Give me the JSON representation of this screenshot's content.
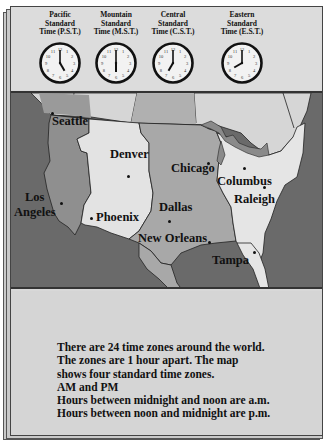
{
  "clocks": [
    {
      "zone": "Pacific",
      "line2": "Standard",
      "line3": "Time (P.S.T.)",
      "hour": 5,
      "minute": 0
    },
    {
      "zone": "Mountain",
      "line2": "Standard",
      "line3": "Time (M.S.T.)",
      "hour": 6,
      "minute": 0
    },
    {
      "zone": "Central",
      "line2": "Standard",
      "line3": "Time (C.S.T.)",
      "hour": 7,
      "minute": 0
    },
    {
      "zone": "Eastern",
      "line2": "Standard",
      "line3": "Time (E.S.T.)",
      "hour": 8,
      "minute": 0
    }
  ],
  "map": {
    "cities": [
      {
        "name": "Seattle"
      },
      {
        "name": "Denver"
      },
      {
        "name": "Chicago"
      },
      {
        "name": "Columbus"
      },
      {
        "name": "Los"
      },
      {
        "name": "Angeles"
      },
      {
        "name": "Phoenix"
      },
      {
        "name": "Dallas"
      },
      {
        "name": "Raleigh"
      },
      {
        "name": "New Orleans"
      },
      {
        "name": "Tampa"
      }
    ],
    "colors": {
      "water": "#6a6a6a",
      "pacific_zone": "#8c8c8c",
      "mountain_zone": "#e2e2e2",
      "central_zone": "#a9a9a9",
      "eastern_zone": "#e4e4e4"
    }
  },
  "info": {
    "lines": [
      "There are 24 time zones around the world.",
      "The zones are 1 hour apart. The map",
      "shows four standard time zones.",
      "AM and PM",
      "Hours between midnight and noon are a.m.",
      "Hours between noon and midnight are p.m."
    ]
  }
}
